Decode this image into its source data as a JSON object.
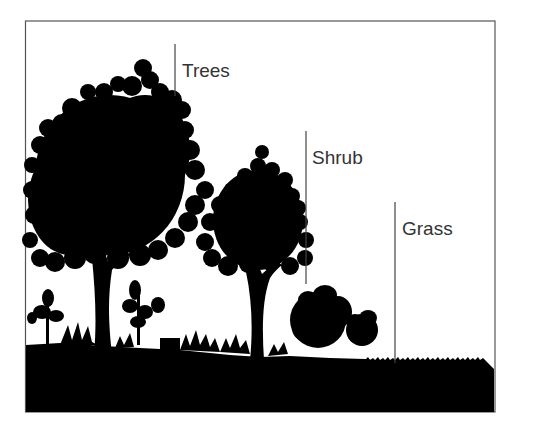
{
  "diagram": {
    "layers": [
      {
        "id": "trees",
        "label": "Trees"
      },
      {
        "id": "shrub",
        "label": "Shrub"
      },
      {
        "id": "grass",
        "label": "Grass"
      }
    ],
    "colors": {
      "silhouette": "#000000",
      "background": "#ffffff",
      "frame": "#555555",
      "label_text": "#333333"
    }
  }
}
